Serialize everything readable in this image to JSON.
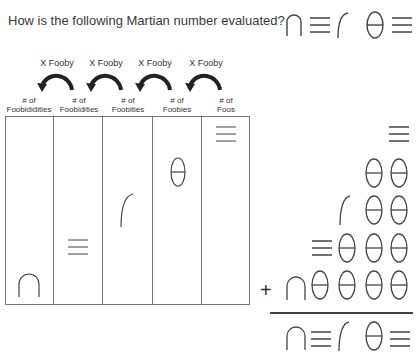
{
  "question": {
    "text": "How is the following Martian number evaluated?",
    "number_symbols": [
      "arch",
      "triple-bar",
      "hook",
      "theta",
      "triple-bar"
    ]
  },
  "arrows": [
    {
      "label": "X Fooby"
    },
    {
      "label": "X Fooby"
    },
    {
      "label": "X Fooby"
    },
    {
      "label": "X Fooby"
    }
  ],
  "place_value_table": {
    "columns": [
      {
        "label_line1": "# of",
        "label_line2": "Foobididities",
        "symbol": "arch"
      },
      {
        "label_line1": "# of",
        "label_line2": "Foobidities",
        "symbol": "triple-bar"
      },
      {
        "label_line1": "# of",
        "label_line2": "Foobities",
        "symbol": "hook"
      },
      {
        "label_line1": "# of",
        "label_line2": "Foobies",
        "symbol": "theta"
      },
      {
        "label_line1": "# of",
        "label_line2": "Foos",
        "symbol": "triple-bar"
      }
    ]
  },
  "addition": {
    "operator": "+",
    "rows": [
      [
        "triple-bar"
      ],
      [
        "theta",
        "theta"
      ],
      [
        "hook",
        "theta",
        "theta"
      ],
      [
        "triple-bar",
        "theta",
        "theta",
        "theta"
      ],
      [
        "arch",
        "theta",
        "theta",
        "theta",
        "theta"
      ]
    ],
    "result": [
      "arch",
      "triple-bar",
      "hook",
      "theta",
      "triple-bar"
    ]
  },
  "colors": {
    "ink": "#444444",
    "border": "#777777",
    "arrow": "#222222"
  }
}
